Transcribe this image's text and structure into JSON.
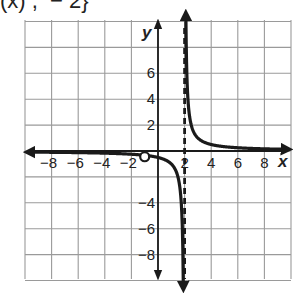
{
  "header": {
    "clipped_text": "(x) ,  − 2}"
  },
  "chart_data": {
    "type": "line",
    "title": "",
    "xlabel": "x",
    "ylabel": "y",
    "xlim": [
      -10,
      10
    ],
    "ylim": [
      -10,
      10
    ],
    "grid": true,
    "grid_step": 2,
    "x_ticks": [
      "−8",
      "−6",
      "−4",
      "−2",
      "2",
      "4",
      "6",
      "8"
    ],
    "y_ticks": [
      "6",
      "4",
      "2",
      "−4",
      "−6",
      "−8"
    ],
    "function": "f(x) = 1/(x − 2)",
    "vertical_asymptote": {
      "x": 2,
      "style": "dashed"
    },
    "horizontal_asymptote": {
      "y": 0
    },
    "hole": {
      "x": -1,
      "y": -0.33,
      "style": "open-circle"
    },
    "series": [
      {
        "name": "left-branch",
        "x": [
          -10,
          -8,
          -6,
          -4,
          -2,
          -1,
          0,
          0.5,
          1,
          1.3,
          1.5,
          1.7,
          1.8,
          1.9
        ],
        "y": [
          -0.08,
          -0.1,
          -0.13,
          -0.17,
          -0.25,
          -0.33,
          -0.5,
          -0.67,
          -1,
          -1.43,
          -2,
          -3.33,
          -5,
          -10
        ]
      },
      {
        "name": "right-branch",
        "x": [
          2.1,
          2.2,
          2.3,
          2.5,
          2.7,
          3,
          3.5,
          4,
          5,
          6,
          7,
          8,
          10
        ],
        "y": [
          10,
          5,
          3.33,
          2,
          1.43,
          1,
          0.67,
          0.5,
          0.33,
          0.25,
          0.2,
          0.17,
          0.1
        ]
      }
    ],
    "colors": {
      "curve": "#1a1a1a",
      "grid": "#9a9a9a",
      "axis": "#1a1a1a"
    }
  }
}
